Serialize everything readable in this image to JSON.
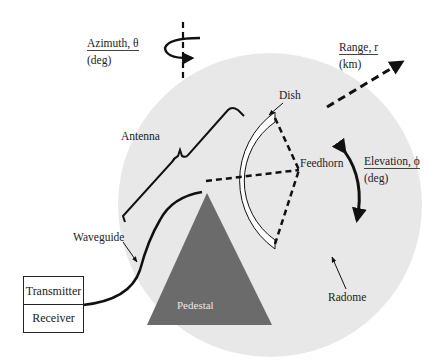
{
  "diagram": {
    "labels": {
      "azimuth": {
        "name": "Azimuth, θ",
        "unit": "(deg)"
      },
      "range": {
        "name": "Range, r",
        "unit": "(km)"
      },
      "elevation": {
        "name": "Elevation, ϕ",
        "unit": "(deg)"
      },
      "antenna": "Antenna",
      "dish": "Dish",
      "feedhorn": "Feedhorn",
      "waveguide": "Waveguide",
      "radome": "Radome",
      "pedestal": "Pedestal",
      "transmitter": "Transmitter",
      "receiver": "Receiver"
    },
    "colors": {
      "radome_fill": "#e8e8e8",
      "pedestal_fill": "#6b6b6b",
      "dish_fill": "#ffffff",
      "stroke": "#111111"
    }
  }
}
